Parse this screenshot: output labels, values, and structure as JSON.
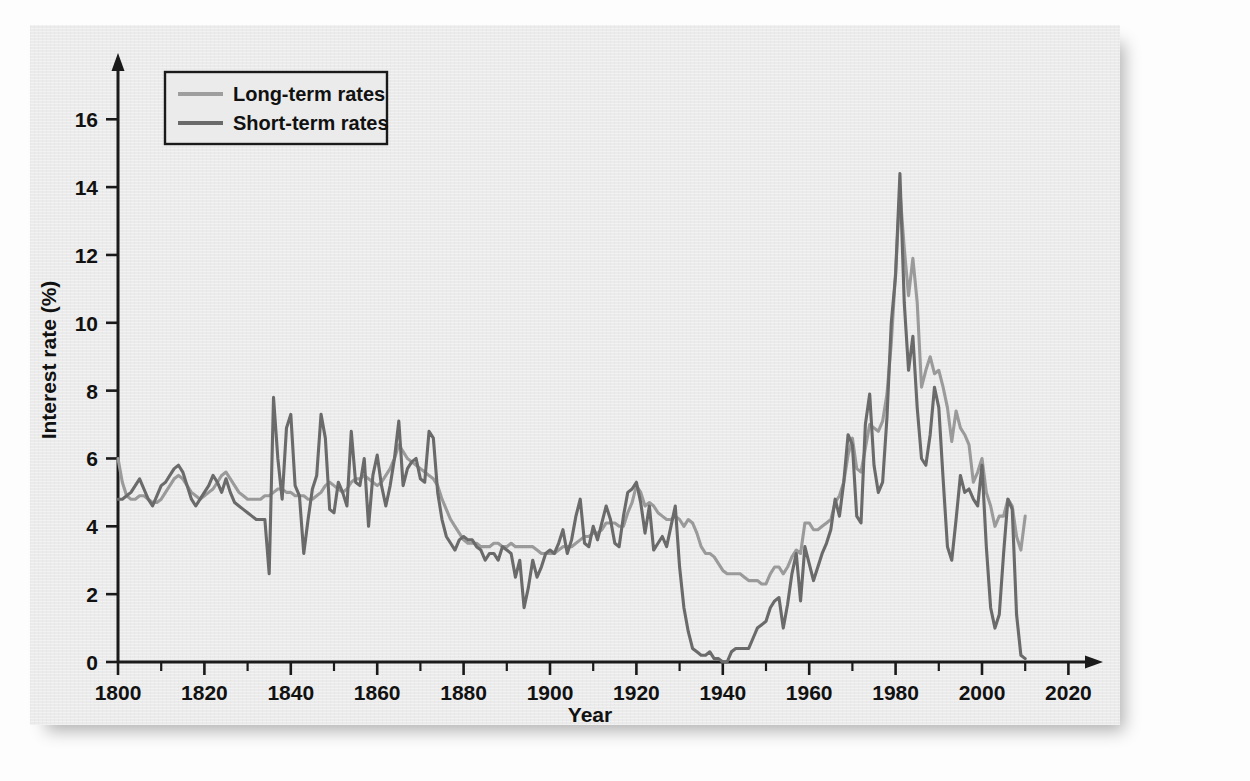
{
  "page": {
    "background_color": "#fdfdfd",
    "figure_background_color": "#ebebeb",
    "cropped_caption_top": ""
  },
  "figure": {
    "panel_name": "interest-rate-figure-panel"
  },
  "legend": {
    "position": "top-left-inside",
    "entries": [
      {
        "label": "Long-term rates",
        "color": "#9a9a9a",
        "series_key": "long_term"
      },
      {
        "label": "Short-term rates",
        "color": "#6a6a6a",
        "series_key": "short_term"
      }
    ]
  },
  "axes": {
    "x": {
      "label": "Year",
      "min": 1800,
      "max": 2025,
      "major_ticks": [
        1800,
        1820,
        1840,
        1860,
        1880,
        1900,
        1920,
        1940,
        1960,
        1980,
        2000,
        2020
      ],
      "tick_labels": [
        "1800",
        "1820",
        "1840",
        "1860",
        "1880",
        "1900",
        "1920",
        "1940",
        "1960",
        "1980",
        "2000",
        "2020"
      ],
      "minor_tick_step": 10,
      "has_arrow_head": true
    },
    "y": {
      "label": "Interest rate (%)",
      "min": 0,
      "max": 17.6,
      "major_ticks": [
        0,
        2,
        4,
        6,
        8,
        10,
        12,
        14,
        16
      ],
      "tick_labels": [
        "0",
        "2",
        "4",
        "6",
        "8",
        "10",
        "12",
        "14",
        "16"
      ],
      "has_arrow_head": true
    },
    "grid": false
  },
  "chart_data": {
    "type": "line",
    "title": "",
    "xlabel": "Year",
    "ylabel": "Interest rate (%)",
    "xlim": [
      1800,
      2025
    ],
    "ylim": [
      0,
      17.6
    ],
    "grid": false,
    "legend_position": "upper left",
    "x": [
      1800,
      1801,
      1802,
      1803,
      1804,
      1805,
      1806,
      1807,
      1808,
      1809,
      1810,
      1811,
      1812,
      1813,
      1814,
      1815,
      1816,
      1817,
      1818,
      1819,
      1820,
      1821,
      1822,
      1823,
      1824,
      1825,
      1826,
      1827,
      1828,
      1829,
      1830,
      1831,
      1832,
      1833,
      1834,
      1835,
      1836,
      1837,
      1838,
      1839,
      1840,
      1841,
      1842,
      1843,
      1844,
      1845,
      1846,
      1847,
      1848,
      1849,
      1850,
      1851,
      1852,
      1853,
      1854,
      1855,
      1856,
      1857,
      1858,
      1859,
      1860,
      1861,
      1862,
      1863,
      1864,
      1865,
      1866,
      1867,
      1868,
      1869,
      1870,
      1871,
      1872,
      1873,
      1874,
      1875,
      1876,
      1877,
      1878,
      1879,
      1880,
      1881,
      1882,
      1883,
      1884,
      1885,
      1886,
      1887,
      1888,
      1889,
      1890,
      1891,
      1892,
      1893,
      1894,
      1895,
      1896,
      1897,
      1898,
      1899,
      1900,
      1901,
      1902,
      1903,
      1904,
      1905,
      1906,
      1907,
      1908,
      1909,
      1910,
      1911,
      1912,
      1913,
      1914,
      1915,
      1916,
      1917,
      1918,
      1919,
      1920,
      1921,
      1922,
      1923,
      1924,
      1925,
      1926,
      1927,
      1928,
      1929,
      1930,
      1931,
      1932,
      1933,
      1934,
      1935,
      1936,
      1937,
      1938,
      1939,
      1940,
      1941,
      1942,
      1943,
      1944,
      1945,
      1946,
      1947,
      1948,
      1949,
      1950,
      1951,
      1952,
      1953,
      1954,
      1955,
      1956,
      1957,
      1958,
      1959,
      1960,
      1961,
      1962,
      1963,
      1964,
      1965,
      1966,
      1967,
      1968,
      1969,
      1970,
      1971,
      1972,
      1973,
      1974,
      1975,
      1976,
      1977,
      1978,
      1979,
      1980,
      1981,
      1982,
      1983,
      1984,
      1985,
      1986,
      1987,
      1988,
      1989,
      1990,
      1991,
      1992,
      1993,
      1994,
      1995,
      1996,
      1997,
      1998,
      1999,
      2000,
      2001,
      2002,
      2003,
      2004,
      2005,
      2006,
      2007,
      2008,
      2009,
      2010
    ],
    "series": [
      {
        "name": "Long-term rates",
        "color": "#9a9a9a",
        "values": [
          6.0,
          5.3,
          4.9,
          4.8,
          4.8,
          4.9,
          4.9,
          4.8,
          4.7,
          4.7,
          4.8,
          5.0,
          5.2,
          5.4,
          5.5,
          5.4,
          5.2,
          5.0,
          4.9,
          4.8,
          4.9,
          5.0,
          5.1,
          5.3,
          5.5,
          5.6,
          5.4,
          5.2,
          5.0,
          4.9,
          4.8,
          4.8,
          4.8,
          4.8,
          4.9,
          4.9,
          5.0,
          5.1,
          5.1,
          5.0,
          5.0,
          4.9,
          4.9,
          4.9,
          4.8,
          4.8,
          4.9,
          5.0,
          5.2,
          5.3,
          5.2,
          5.1,
          5.0,
          5.1,
          5.3,
          5.4,
          5.4,
          5.5,
          5.4,
          5.3,
          5.2,
          5.3,
          5.5,
          5.7,
          6.0,
          6.4,
          6.2,
          6.0,
          5.9,
          5.8,
          5.7,
          5.6,
          5.5,
          5.4,
          5.2,
          4.8,
          4.5,
          4.2,
          4.0,
          3.8,
          3.6,
          3.5,
          3.5,
          3.5,
          3.4,
          3.4,
          3.4,
          3.5,
          3.5,
          3.4,
          3.4,
          3.5,
          3.4,
          3.4,
          3.4,
          3.4,
          3.4,
          3.3,
          3.2,
          3.2,
          3.2,
          3.2,
          3.3,
          3.4,
          3.4,
          3.4,
          3.5,
          3.6,
          3.7,
          3.7,
          3.8,
          3.8,
          3.9,
          4.1,
          4.1,
          4.1,
          4.0,
          4.0,
          4.4,
          4.7,
          5.2,
          5.0,
          4.6,
          4.7,
          4.6,
          4.4,
          4.3,
          4.2,
          4.2,
          4.3,
          4.2,
          4.0,
          4.2,
          4.1,
          3.8,
          3.4,
          3.2,
          3.2,
          3.1,
          2.9,
          2.7,
          2.6,
          2.6,
          2.6,
          2.6,
          2.5,
          2.4,
          2.4,
          2.4,
          2.3,
          2.3,
          2.6,
          2.8,
          2.8,
          2.6,
          2.8,
          3.1,
          3.3,
          3.2,
          4.1,
          4.1,
          3.9,
          3.9,
          4.0,
          4.1,
          4.2,
          4.7,
          4.9,
          5.3,
          6.1,
          6.6,
          5.7,
          5.6,
          6.3,
          7.0,
          6.9,
          6.8,
          7.1,
          7.9,
          9.4,
          11.5,
          13.9,
          12.2,
          10.8,
          11.9,
          10.6,
          8.1,
          8.6,
          9.0,
          8.5,
          8.6,
          8.1,
          7.5,
          6.5,
          7.4,
          6.9,
          6.7,
          6.4,
          5.3,
          5.6,
          6.0,
          5.0,
          4.6,
          4.0,
          4.3,
          4.3,
          4.8,
          4.6,
          3.7,
          3.3,
          4.3
        ]
      },
      {
        "name": "Short-term rates",
        "color": "#6a6a6a",
        "values": [
          4.8,
          4.8,
          4.9,
          5.0,
          5.2,
          5.4,
          5.1,
          4.8,
          4.6,
          4.9,
          5.2,
          5.3,
          5.5,
          5.7,
          5.8,
          5.6,
          5.2,
          4.8,
          4.6,
          4.8,
          5.0,
          5.2,
          5.5,
          5.3,
          5.0,
          5.4,
          5.0,
          4.7,
          4.6,
          4.5,
          4.4,
          4.3,
          4.2,
          4.2,
          4.2,
          2.6,
          7.8,
          6.0,
          4.8,
          6.9,
          7.3,
          5.2,
          4.9,
          3.2,
          4.2,
          5.1,
          5.5,
          7.3,
          6.6,
          4.5,
          4.4,
          5.3,
          5.0,
          4.6,
          6.8,
          5.3,
          5.2,
          6.0,
          4.0,
          5.5,
          6.1,
          5.2,
          4.6,
          5.2,
          6.0,
          7.1,
          5.2,
          5.7,
          5.9,
          6.0,
          5.4,
          5.3,
          6.8,
          6.6,
          5.0,
          4.2,
          3.7,
          3.5,
          3.3,
          3.6,
          3.7,
          3.6,
          3.6,
          3.4,
          3.3,
          3.0,
          3.2,
          3.2,
          3.0,
          3.4,
          3.3,
          3.2,
          2.5,
          3.0,
          1.6,
          2.2,
          3.0,
          2.5,
          2.8,
          3.2,
          3.3,
          3.2,
          3.5,
          3.9,
          3.2,
          3.6,
          4.3,
          4.8,
          3.5,
          3.4,
          4.0,
          3.6,
          4.1,
          4.6,
          4.2,
          3.5,
          3.4,
          4.3,
          5.0,
          5.1,
          5.3,
          4.7,
          3.8,
          4.6,
          3.3,
          3.5,
          3.7,
          3.4,
          4.0,
          4.6,
          2.8,
          1.6,
          0.9,
          0.4,
          0.3,
          0.2,
          0.2,
          0.3,
          0.1,
          0.1,
          0.0,
          0.0,
          0.3,
          0.4,
          0.4,
          0.4,
          0.4,
          0.7,
          1.0,
          1.1,
          1.2,
          1.6,
          1.8,
          1.9,
          1.0,
          1.7,
          2.6,
          3.2,
          1.8,
          3.4,
          2.9,
          2.4,
          2.8,
          3.2,
          3.5,
          3.9,
          4.8,
          4.3,
          5.3,
          6.7,
          6.4,
          4.3,
          4.1,
          7.0,
          7.9,
          5.8,
          5.0,
          5.3,
          7.2,
          10.0,
          11.4,
          14.4,
          10.6,
          8.6,
          9.6,
          7.5,
          6.0,
          5.8,
          6.7,
          8.1,
          7.5,
          5.4,
          3.4,
          3.0,
          4.2,
          5.5,
          5.0,
          5.1,
          4.8,
          4.6,
          5.8,
          3.4,
          1.6,
          1.0,
          1.4,
          3.2,
          4.8,
          4.5,
          1.4,
          0.2,
          0.1
        ]
      }
    ]
  }
}
